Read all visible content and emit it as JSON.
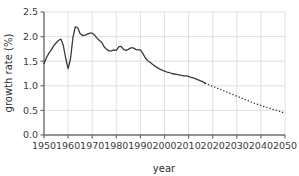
{
  "chart_data": {
    "type": "line",
    "title": "",
    "subtitle": "",
    "xlabel": "year",
    "ylabel": "growth rate (%)",
    "xlim": [
      1950,
      2050
    ],
    "ylim": [
      0.0,
      2.5
    ],
    "grid": true,
    "legend_position": "none",
    "xticks": [
      1950,
      1960,
      1970,
      1980,
      1990,
      2000,
      2010,
      2020,
      2030,
      2040,
      2050
    ],
    "xtick_labels": [
      "1950",
      "1960",
      "1970",
      "1980",
      "1990",
      "2000",
      "2010",
      "2020",
      "2030",
      "2040",
      "2050"
    ],
    "yticks": [
      0.0,
      0.5,
      1.0,
      1.5,
      2.0,
      2.5
    ],
    "ytick_labels": [
      "0.0",
      "0.5",
      "1.0",
      "1.5",
      "2.0",
      "2.5"
    ],
    "line_color": "#3a3a3a",
    "grid_color": "#d8d8d8",
    "axis_color": "#6e6e6e",
    "series": [
      {
        "name": "observed growth rate",
        "style": "solid",
        "x": [
          1950,
          1951,
          1952,
          1953,
          1954,
          1955,
          1956,
          1957,
          1958,
          1959,
          1960,
          1961,
          1962,
          1963,
          1964,
          1965,
          1966,
          1967,
          1968,
          1969,
          1970,
          1971,
          1972,
          1973,
          1974,
          1975,
          1976,
          1977,
          1978,
          1979,
          1980,
          1981,
          1982,
          1983,
          1984,
          1985,
          1986,
          1987,
          1988,
          1989,
          1990,
          1991,
          1992,
          1993,
          1994,
          1995,
          1996,
          1997,
          1998,
          1999,
          2000,
          2001,
          2002,
          2003,
          2004,
          2005,
          2006,
          2007,
          2008,
          2009,
          2010,
          2011,
          2012,
          2013,
          2014,
          2015,
          2016,
          2017
        ],
        "values": [
          1.45,
          1.57,
          1.66,
          1.73,
          1.81,
          1.87,
          1.92,
          1.95,
          1.82,
          1.56,
          1.35,
          1.55,
          1.98,
          2.2,
          2.18,
          2.06,
          2.02,
          2.03,
          2.05,
          2.07,
          2.07,
          2.03,
          1.97,
          1.92,
          1.88,
          1.79,
          1.74,
          1.71,
          1.71,
          1.73,
          1.72,
          1.79,
          1.8,
          1.74,
          1.72,
          1.74,
          1.77,
          1.77,
          1.74,
          1.73,
          1.73,
          1.66,
          1.57,
          1.51,
          1.48,
          1.44,
          1.4,
          1.37,
          1.34,
          1.32,
          1.3,
          1.28,
          1.27,
          1.25,
          1.24,
          1.23,
          1.22,
          1.21,
          1.2,
          1.2,
          1.19,
          1.17,
          1.16,
          1.14,
          1.12,
          1.1,
          1.08,
          1.05
        ]
      },
      {
        "name": "projected growth rate",
        "style": "dotted",
        "x": [
          2017,
          2018,
          2019,
          2020,
          2021,
          2022,
          2023,
          2024,
          2025,
          2026,
          2027,
          2028,
          2029,
          2030,
          2031,
          2032,
          2033,
          2034,
          2035,
          2036,
          2037,
          2038,
          2039,
          2040,
          2041,
          2042,
          2043,
          2044,
          2045,
          2046,
          2047,
          2048,
          2049,
          2050
        ],
        "values": [
          1.05,
          1.03,
          1.01,
          0.99,
          0.97,
          0.95,
          0.93,
          0.91,
          0.89,
          0.87,
          0.85,
          0.83,
          0.81,
          0.79,
          0.77,
          0.75,
          0.73,
          0.71,
          0.69,
          0.67,
          0.65,
          0.63,
          0.62,
          0.6,
          0.58,
          0.57,
          0.55,
          0.54,
          0.52,
          0.51,
          0.49,
          0.48,
          0.46,
          0.44
        ]
      }
    ]
  }
}
